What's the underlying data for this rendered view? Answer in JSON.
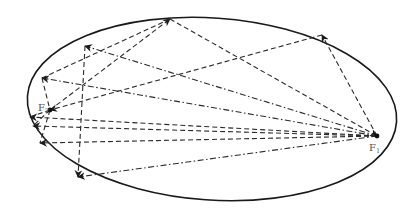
{
  "diagram": {
    "title": "",
    "foci": [
      {
        "id": "F1",
        "label": "F",
        "subscript": "1"
      },
      {
        "id": "F2",
        "label": "F",
        "subscript": "2"
      }
    ],
    "colors": {
      "curve": "#1a1a1a",
      "rays": "#2a2a2a",
      "labels": "#555555"
    }
  }
}
